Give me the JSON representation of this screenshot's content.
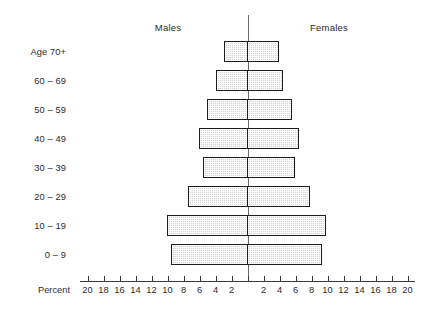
{
  "chart_data": {
    "type": "bar",
    "subtype": "population-pyramid",
    "title": "",
    "xlabel": "Percent",
    "ylabel": "",
    "grid": false,
    "legend_position": "top",
    "axis_unit_px": 8,
    "center_x_px": 247.5,
    "xlim": [
      -20,
      20
    ],
    "x_ticks": [
      20,
      18,
      16,
      14,
      12,
      10,
      8,
      6,
      4,
      2,
      0,
      2,
      4,
      6,
      8,
      10,
      12,
      14,
      16,
      18,
      20
    ],
    "categories": [
      "Age 70+",
      "60 – 69",
      "50 – 59",
      "40 – 49",
      "30 – 39",
      "20 – 29",
      "10 – 19",
      "0 – 9"
    ],
    "series": [
      {
        "name": "Males",
        "values": [
          2.9,
          4.0,
          5.1,
          6.1,
          5.6,
          7.4,
          10.1,
          9.6
        ]
      },
      {
        "name": "Females",
        "values": [
          3.9,
          4.4,
          5.5,
          6.4,
          5.9,
          7.8,
          9.8,
          9.3
        ]
      }
    ],
    "rows": [
      {
        "label": "Age 70+",
        "male": 2.9,
        "female": 3.9
      },
      {
        "label": "60 – 69",
        "male": 4.0,
        "female": 4.4
      },
      {
        "label": "50 – 59",
        "male": 5.1,
        "female": 5.5
      },
      {
        "label": "40 – 49",
        "male": 6.1,
        "female": 6.4
      },
      {
        "label": "30 – 39",
        "male": 5.6,
        "female": 5.9
      },
      {
        "label": "20 – 29",
        "male": 7.4,
        "female": 7.8
      },
      {
        "label": "10 – 19",
        "male": 10.1,
        "female": 9.8
      },
      {
        "label": "0 – 9",
        "male": 9.6,
        "female": 9.3
      }
    ],
    "colors": {
      "bar_fill": "#d2d2d2",
      "bar_border": "#1d1d1d",
      "axis": "#3a3a3a",
      "center_line": "#6b6b6b",
      "text": "#2b2b2b",
      "background": "#ffffff"
    }
  },
  "header": {
    "males_label": "Males",
    "females_label": "Females"
  },
  "axis": {
    "percent_label": "Percent"
  }
}
